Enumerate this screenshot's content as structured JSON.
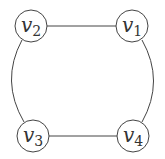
{
  "diagram": {
    "type": "graph",
    "nodes": [
      {
        "id": "v1",
        "label": "v",
        "sub": "1",
        "cx": 132,
        "cy": 26
      },
      {
        "id": "v2",
        "label": "v",
        "sub": "2",
        "cx": 31,
        "cy": 26
      },
      {
        "id": "v3",
        "label": "v",
        "sub": "3",
        "cx": 33,
        "cy": 136
      },
      {
        "id": "v4",
        "label": "v",
        "sub": "4",
        "cx": 133,
        "cy": 136
      }
    ],
    "edges": [
      {
        "from": "v2",
        "to": "v1",
        "shape": "straight"
      },
      {
        "from": "v3",
        "to": "v4",
        "shape": "straight"
      },
      {
        "from": "v2",
        "to": "v3",
        "shape": "arc"
      },
      {
        "from": "v1",
        "to": "v4",
        "shape": "arc"
      }
    ],
    "colors": {
      "stroke": "#444444",
      "text": "#333333"
    }
  }
}
